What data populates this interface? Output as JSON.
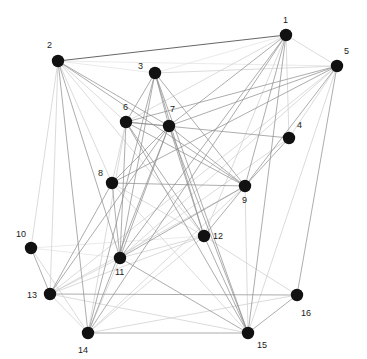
{
  "figure": {
    "type": "network-graph",
    "width": 367,
    "height": 359,
    "background_color": "#ffffff",
    "node_color": "#111111",
    "node_radius": 6.2,
    "label_color": "#1a1a1a",
    "label_font_size": 9,
    "edge_colors": {
      "dark": "#4a4a4a",
      "mid": "#8c8c8c",
      "light": "#d2d2d2",
      "faint": "#e4e4e4"
    }
  },
  "chart_data": {
    "type": "scatter",
    "title": "",
    "xlabel": "",
    "ylabel": "",
    "grid": false,
    "legend": "none",
    "xlim": [
      0,
      367
    ],
    "ylim": [
      0,
      359
    ],
    "nodes": [
      {
        "id": 1,
        "label": "1",
        "x": 286,
        "y": 35,
        "label_dx": -3,
        "label_dy": -19
      },
      {
        "id": 2,
        "label": "2",
        "x": 58,
        "y": 61,
        "label_dx": -11,
        "label_dy": -20
      },
      {
        "id": 3,
        "label": "3",
        "x": 155,
        "y": 73,
        "label_dx": -17,
        "label_dy": -11
      },
      {
        "id": 4,
        "label": "4",
        "x": 289,
        "y": 138,
        "label_dx": 8,
        "label_dy": -17
      },
      {
        "id": 5,
        "label": "5",
        "x": 337,
        "y": 66,
        "label_dx": 7,
        "label_dy": -19
      },
      {
        "id": 6,
        "label": "6",
        "x": 126,
        "y": 122,
        "label_dx": -3,
        "label_dy": -19
      },
      {
        "id": 7,
        "label": "7",
        "x": 169,
        "y": 126,
        "label_dx": 1,
        "label_dy": -21
      },
      {
        "id": 8,
        "label": "8",
        "x": 112,
        "y": 183,
        "label_dx": -14,
        "label_dy": -14
      },
      {
        "id": 9,
        "label": "9",
        "x": 245,
        "y": 186,
        "label_dx": -3,
        "label_dy": 10
      },
      {
        "id": 10,
        "label": "10",
        "x": 31,
        "y": 248,
        "label_dx": -15,
        "label_dy": -18
      },
      {
        "id": 11,
        "label": "11",
        "x": 120,
        "y": 258,
        "label_dx": -5,
        "label_dy": 10
      },
      {
        "id": 12,
        "label": "12",
        "x": 204,
        "y": 236,
        "label_dx": 9,
        "label_dy": -4
      },
      {
        "id": 13,
        "label": "13",
        "x": 50,
        "y": 294,
        "label_dx": -23,
        "label_dy": -3
      },
      {
        "id": 14,
        "label": "14",
        "x": 88,
        "y": 333,
        "label_dx": -10,
        "label_dy": 13
      },
      {
        "id": 15,
        "label": "15",
        "x": 248,
        "y": 333,
        "label_dx": 9,
        "label_dy": 8
      },
      {
        "id": 16,
        "label": "16",
        "x": 297,
        "y": 295,
        "label_dx": 4,
        "label_dy": 14
      }
    ],
    "edges": [
      {
        "source": 1,
        "target": 2,
        "tone": "dark"
      },
      {
        "source": 1,
        "target": 3,
        "tone": "faint"
      },
      {
        "source": 1,
        "target": 4,
        "tone": "light"
      },
      {
        "source": 1,
        "target": 5,
        "tone": "light"
      },
      {
        "source": 1,
        "target": 6,
        "tone": "light"
      },
      {
        "source": 1,
        "target": 7,
        "tone": "mid"
      },
      {
        "source": 1,
        "target": 9,
        "tone": "mid"
      },
      {
        "source": 1,
        "target": 11,
        "tone": "mid"
      },
      {
        "source": 1,
        "target": 12,
        "tone": "light"
      },
      {
        "source": 1,
        "target": 14,
        "tone": "mid"
      },
      {
        "source": 1,
        "target": 15,
        "tone": "mid"
      },
      {
        "source": 2,
        "target": 3,
        "tone": "faint"
      },
      {
        "source": 2,
        "target": 5,
        "tone": "faint"
      },
      {
        "source": 2,
        "target": 6,
        "tone": "light"
      },
      {
        "source": 2,
        "target": 7,
        "tone": "mid"
      },
      {
        "source": 2,
        "target": 8,
        "tone": "light"
      },
      {
        "source": 2,
        "target": 9,
        "tone": "mid"
      },
      {
        "source": 2,
        "target": 11,
        "tone": "mid"
      },
      {
        "source": 2,
        "target": 12,
        "tone": "light"
      },
      {
        "source": 2,
        "target": 13,
        "tone": "light"
      },
      {
        "source": 2,
        "target": 14,
        "tone": "mid"
      },
      {
        "source": 3,
        "target": 5,
        "tone": "light"
      },
      {
        "source": 3,
        "target": 6,
        "tone": "mid"
      },
      {
        "source": 3,
        "target": 7,
        "tone": "mid"
      },
      {
        "source": 3,
        "target": 9,
        "tone": "mid"
      },
      {
        "source": 3,
        "target": 11,
        "tone": "mid"
      },
      {
        "source": 3,
        "target": 12,
        "tone": "mid"
      },
      {
        "source": 3,
        "target": 14,
        "tone": "mid"
      },
      {
        "source": 3,
        "target": 15,
        "tone": "mid"
      },
      {
        "source": 4,
        "target": 5,
        "tone": "light"
      },
      {
        "source": 4,
        "target": 6,
        "tone": "mid"
      },
      {
        "source": 4,
        "target": 9,
        "tone": "mid"
      },
      {
        "source": 4,
        "target": 11,
        "tone": "light"
      },
      {
        "source": 5,
        "target": 6,
        "tone": "mid"
      },
      {
        "source": 5,
        "target": 7,
        "tone": "mid"
      },
      {
        "source": 5,
        "target": 8,
        "tone": "mid"
      },
      {
        "source": 5,
        "target": 9,
        "tone": "mid"
      },
      {
        "source": 5,
        "target": 11,
        "tone": "light"
      },
      {
        "source": 5,
        "target": 13,
        "tone": "light"
      },
      {
        "source": 5,
        "target": 15,
        "tone": "light"
      },
      {
        "source": 5,
        "target": 16,
        "tone": "mid"
      },
      {
        "source": 6,
        "target": 7,
        "tone": "mid"
      },
      {
        "source": 6,
        "target": 8,
        "tone": "light"
      },
      {
        "source": 6,
        "target": 9,
        "tone": "mid"
      },
      {
        "source": 6,
        "target": 11,
        "tone": "mid"
      },
      {
        "source": 6,
        "target": 12,
        "tone": "mid"
      },
      {
        "source": 6,
        "target": 14,
        "tone": "light"
      },
      {
        "source": 6,
        "target": 15,
        "tone": "mid"
      },
      {
        "source": 7,
        "target": 8,
        "tone": "mid"
      },
      {
        "source": 7,
        "target": 9,
        "tone": "mid"
      },
      {
        "source": 7,
        "target": 11,
        "tone": "mid"
      },
      {
        "source": 7,
        "target": 12,
        "tone": "mid"
      },
      {
        "source": 7,
        "target": 13,
        "tone": "mid"
      },
      {
        "source": 7,
        "target": 14,
        "tone": "mid"
      },
      {
        "source": 7,
        "target": 15,
        "tone": "mid"
      },
      {
        "source": 8,
        "target": 9,
        "tone": "mid"
      },
      {
        "source": 8,
        "target": 11,
        "tone": "mid"
      },
      {
        "source": 8,
        "target": 12,
        "tone": "light"
      },
      {
        "source": 8,
        "target": 13,
        "tone": "mid"
      },
      {
        "source": 8,
        "target": 15,
        "tone": "light"
      },
      {
        "source": 9,
        "target": 11,
        "tone": "mid"
      },
      {
        "source": 9,
        "target": 12,
        "tone": "mid"
      },
      {
        "source": 9,
        "target": 13,
        "tone": "light"
      },
      {
        "source": 9,
        "target": 14,
        "tone": "light"
      },
      {
        "source": 9,
        "target": 15,
        "tone": "light"
      },
      {
        "source": 10,
        "target": 2,
        "tone": "light"
      },
      {
        "source": 10,
        "target": 11,
        "tone": "faint"
      },
      {
        "source": 10,
        "target": 12,
        "tone": "faint"
      },
      {
        "source": 10,
        "target": 13,
        "tone": "mid"
      },
      {
        "source": 10,
        "target": 14,
        "tone": "light"
      },
      {
        "source": 11,
        "target": 12,
        "tone": "light"
      },
      {
        "source": 11,
        "target": 13,
        "tone": "light"
      },
      {
        "source": 11,
        "target": 14,
        "tone": "light"
      },
      {
        "source": 11,
        "target": 15,
        "tone": "mid"
      },
      {
        "source": 12,
        "target": 13,
        "tone": "light"
      },
      {
        "source": 12,
        "target": 14,
        "tone": "light"
      },
      {
        "source": 12,
        "target": 15,
        "tone": "mid"
      },
      {
        "source": 12,
        "target": 16,
        "tone": "light"
      },
      {
        "source": 13,
        "target": 14,
        "tone": "light"
      },
      {
        "source": 13,
        "target": 15,
        "tone": "light"
      },
      {
        "source": 13,
        "target": 16,
        "tone": "mid"
      },
      {
        "source": 14,
        "target": 15,
        "tone": "mid"
      },
      {
        "source": 14,
        "target": 16,
        "tone": "light"
      },
      {
        "source": 15,
        "target": 16,
        "tone": "mid"
      }
    ]
  }
}
